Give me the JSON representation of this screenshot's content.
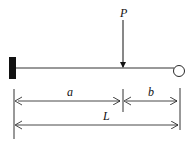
{
  "diagram": {
    "load_label": "P",
    "dim_a_label": "a",
    "dim_b_label": "b",
    "dim_L_label": "L",
    "colors": {
      "line": "#111111",
      "background": "#ffffff"
    }
  }
}
